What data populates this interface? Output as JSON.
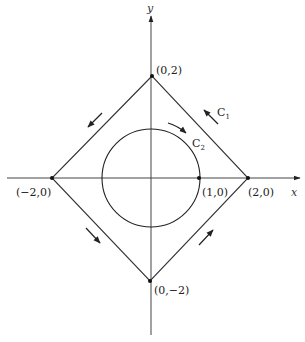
{
  "diagram": {
    "type": "contour-integration-figure",
    "axes": {
      "x_label": "x",
      "y_label": "y"
    },
    "curves": [
      {
        "name": "C1",
        "label": "C",
        "subscript": "1",
        "shape": "square (diamond) with vertices (0,2), (-2,0), (0,-2), (2,0)",
        "orientation": "counterclockwise"
      },
      {
        "name": "C2",
        "label": "C",
        "subscript": "2",
        "shape": "circle of radius 1 centered at origin",
        "orientation": "clockwise"
      }
    ],
    "points": [
      {
        "label": "(0,2)",
        "x": 0,
        "y": 2
      },
      {
        "label": "(−2,0)",
        "x": -2,
        "y": 0
      },
      {
        "label": "(1,0)",
        "x": 1,
        "y": 0
      },
      {
        "label": "(2,0)",
        "x": 2,
        "y": 0
      },
      {
        "label": "(0,−2)",
        "x": 0,
        "y": -2
      }
    ],
    "colors": {
      "line": "#333333",
      "background": "#ffffff"
    }
  }
}
